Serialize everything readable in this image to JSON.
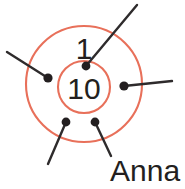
{
  "figure": {
    "name": "concentric-circle-node-diagram",
    "background_color": "#ffffff"
  },
  "colors": {
    "ring_stroke": "#e8705a",
    "line_stroke": "#2e2b2c",
    "dot_fill": "#231f20",
    "text_fill": "#231f20"
  },
  "rings": {
    "outer": {
      "label": "outer-ring",
      "cx": 84,
      "cy": 84,
      "r": 58,
      "stroke_width": 2.1
    },
    "inner": {
      "label": "inner-ring",
      "cx": 84,
      "cy": 87,
      "r": 26,
      "stroke_width": 2.1
    }
  },
  "labels": {
    "outer_ring_value": "1",
    "inner_ring_value": "10",
    "annotation_name": "Anna"
  },
  "label_positions": {
    "outer_ring_value": {
      "x": 84,
      "y": 59,
      "font_size": 30
    },
    "inner_ring_value": {
      "x": 84,
      "y": 99,
      "font_size": 30
    },
    "annotation_name": {
      "x": 110,
      "y": 181,
      "font_size": 30
    }
  },
  "nodes": [
    {
      "name": "node-top-center",
      "cx": 86,
      "cy": 66,
      "r": 4.4,
      "leader": {
        "x1": 86,
        "y1": 66,
        "x2": 137,
        "y2": 5,
        "width": 2.4
      }
    },
    {
      "name": "node-left",
      "cx": 48,
      "cy": 78,
      "r": 4.6,
      "leader": {
        "x1": 48,
        "y1": 78,
        "x2": 7,
        "y2": 52,
        "width": 2.4
      }
    },
    {
      "name": "node-right",
      "cx": 124,
      "cy": 86,
      "r": 4.6,
      "leader": {
        "x1": 124,
        "y1": 86,
        "x2": 172,
        "y2": 81,
        "width": 2.4
      }
    },
    {
      "name": "node-bottom-left",
      "cx": 66,
      "cy": 122,
      "r": 4.4,
      "leader": {
        "x1": 66,
        "y1": 122,
        "x2": 48,
        "y2": 164,
        "width": 2.4
      }
    },
    {
      "name": "node-bottom-right",
      "cx": 95,
      "cy": 122,
      "r": 4.4,
      "leader": {
        "x1": 95,
        "y1": 122,
        "x2": 111,
        "y2": 156,
        "width": 2.4
      }
    }
  ]
}
